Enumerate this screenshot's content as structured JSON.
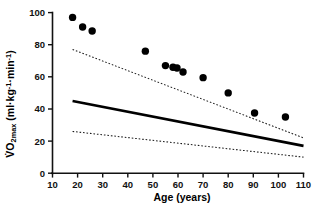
{
  "chart_data": {
    "type": "scatter",
    "title": "",
    "subtitle": "",
    "xlabel": "Age (years)",
    "ylabel": "VO2max (ml·kg-1·min-1)",
    "ylabel_parts": {
      "v_dot": "V",
      "o": "O",
      "sub": "2max",
      "units": " (ml·kg",
      "sup1": "-1",
      "mid": "·min",
      "sup2": "-1",
      "close": ")"
    },
    "xlim": [
      10,
      110
    ],
    "ylim": [
      0,
      100
    ],
    "xticks": [
      10,
      20,
      30,
      40,
      50,
      60,
      70,
      80,
      90,
      100,
      110
    ],
    "yticks": [
      0,
      20,
      40,
      60,
      80,
      100
    ],
    "xtick_labels": [
      "10",
      "20",
      "30",
      "40",
      "50",
      "60",
      "70",
      "80",
      "90",
      "100",
      "110"
    ],
    "ytick_labels": [
      "0",
      "20",
      "40",
      "60",
      "80",
      "100"
    ],
    "grid": false,
    "legend": null,
    "legend_position": "none",
    "marker": {
      "shape": "circle",
      "color": "#000000",
      "size_px": 7.4
    },
    "points": [
      {
        "x": 18.0,
        "y": 97.0
      },
      {
        "x": 22.0,
        "y": 91.0
      },
      {
        "x": 25.8,
        "y": 88.5
      },
      {
        "x": 47.0,
        "y": 76.0
      },
      {
        "x": 55.0,
        "y": 67.0
      },
      {
        "x": 58.0,
        "y": 66.0
      },
      {
        "x": 59.6,
        "y": 65.5
      },
      {
        "x": 62.0,
        "y": 63.0
      },
      {
        "x": 70.0,
        "y": 59.5
      },
      {
        "x": 80.0,
        "y": 50.0
      },
      {
        "x": 90.5,
        "y": 37.5
      },
      {
        "x": 102.8,
        "y": 35.0
      }
    ],
    "series": [
      {
        "name": "regression-line",
        "style": "solid",
        "color": "#000000",
        "x": [
          18,
          110
        ],
        "values": [
          45.0,
          17.0
        ]
      },
      {
        "name": "upper-confidence-limit",
        "style": "dotted",
        "color": "#1a1a1a",
        "x": [
          18,
          110
        ],
        "values": [
          77.0,
          22.0
        ]
      },
      {
        "name": "lower-confidence-limit",
        "style": "dotted",
        "color": "#1a1a1a",
        "x": [
          18,
          110
        ],
        "values": [
          26.0,
          10.0
        ]
      }
    ]
  }
}
